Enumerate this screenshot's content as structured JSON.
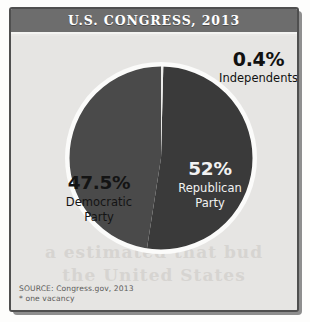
{
  "header": {
    "title": "U.S. CONGRESS, 2013"
  },
  "footer": {
    "source": "SOURCE: Congress.gov, 2013",
    "footnote": "* one vacancy"
  },
  "ghost_text": {
    "line1": "a estimated that bud",
    "line2": "the United States"
  },
  "colors": {
    "panel_background": "#e6e5e3",
    "titlebar_background": "#6d6d6d",
    "frame_border": "#4f4f4f",
    "republican": "#3a3a3a",
    "democratic": "#4a4a4a",
    "independent": "#ededeb",
    "pie_outline": "#fbfbfa",
    "leader_line": "#1a1a1a"
  },
  "chart_data": {
    "type": "pie",
    "title": "U.S. CONGRESS, 2013",
    "xlabel": "",
    "ylabel": "",
    "legend_position": "none",
    "grid": false,
    "start_angle_deg": 0,
    "direction": "clockwise",
    "categories": [
      "Republican Party",
      "Democratic Party",
      "Independents"
    ],
    "values": [
      52,
      47.5,
      0.4
    ],
    "slices": [
      {
        "name": "Republican Party",
        "value": 52,
        "pct_label": "52%",
        "party_label_line1": "Republican",
        "party_label_line2": "Party",
        "color": "#3a3a3a",
        "text_color": "#f2f2f2"
      },
      {
        "name": "Democratic Party",
        "value": 47.5,
        "pct_label": "47.5%",
        "party_label_line1": "Democratic",
        "party_label_line2": "Party",
        "color": "#4a4a4a",
        "text_color": "#141414"
      },
      {
        "name": "Independents",
        "value": 0.4,
        "pct_label": "0.4%",
        "party_label_line1": "Independents",
        "party_label_line2": "",
        "color": "#ededeb",
        "text_color": "#111111",
        "callout": true
      }
    ],
    "source": "SOURCE: Congress.gov, 2013",
    "annotations": [
      "* one vacancy"
    ]
  }
}
